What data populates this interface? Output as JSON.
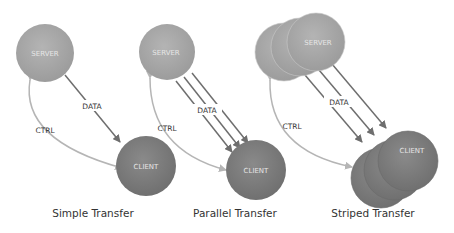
{
  "colors": {
    "server_fill": "#a8a8a8",
    "client_fill": "#7d7d7d",
    "data_arrow": "#6e6e6e",
    "ctrl_arrow": "#b5b5b5",
    "label_text": "#333333"
  },
  "panels": [
    {
      "caption": "Simple Transfer",
      "server_label": "SERVER",
      "client_label": "CLIENT",
      "data_label": "DATA",
      "ctrl_label": "CTRL",
      "data_streams": 1,
      "server_count": 1,
      "client_count": 1
    },
    {
      "caption": "Parallel Transfer",
      "server_label": "SERVER",
      "client_label": "CLIENT",
      "data_label": "DATA",
      "ctrl_label": "CTRL",
      "data_streams": 3,
      "server_count": 1,
      "client_count": 1
    },
    {
      "caption": "Striped Transfer",
      "server_label": "SERVER",
      "client_label": "CLIENT",
      "data_label": "DATA",
      "ctrl_label": "CTRL",
      "data_streams": 3,
      "server_count": 3,
      "client_count": 3
    }
  ]
}
